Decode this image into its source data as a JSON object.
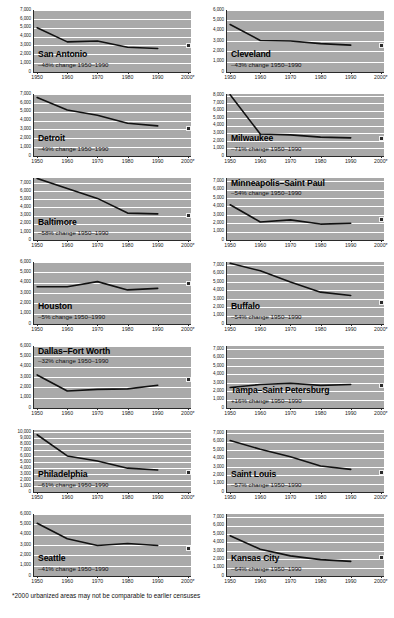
{
  "footnote": "*2000 urbanized areas may not be comparable to earlier censuses",
  "axis": {
    "x_ticks": [
      "1950",
      "1960",
      "1970",
      "1980",
      "1990",
      "2000*"
    ],
    "x_values": [
      1950,
      1960,
      1970,
      1980,
      1990,
      2000
    ]
  },
  "chart_data": [
    {
      "type": "line",
      "title": "San Antonio",
      "annotation": "–48% change 1950–1990",
      "label_position": "bottom",
      "xlabel": "",
      "ylabel": "",
      "ylim": [
        0,
        7000
      ],
      "yticks": [
        0,
        1000,
        2000,
        3000,
        4000,
        5000,
        6000,
        7000
      ],
      "ytick_labels": [
        "0",
        "1,000",
        "2,000",
        "3,000",
        "4,000",
        "5,000",
        "6,000",
        "7,000"
      ],
      "grid": true,
      "x": [
        1950,
        1960,
        1970,
        1980,
        1990
      ],
      "values": [
        5000,
        3400,
        3500,
        2800,
        2650
      ],
      "point_2000": 3050
    },
    {
      "type": "line",
      "title": "Detroit",
      "annotation": "–49% change 1950–1990",
      "label_position": "bottom",
      "xlabel": "",
      "ylabel": "",
      "ylim": [
        0,
        7000
      ],
      "yticks": [
        0,
        1000,
        2000,
        3000,
        4000,
        5000,
        6000,
        7000
      ],
      "ytick_labels": [
        "0",
        "1,000",
        "2,000",
        "3,000",
        "4,000",
        "5,000",
        "6,000",
        "7,000"
      ],
      "grid": true,
      "x": [
        1950,
        1960,
        1970,
        1980,
        1990
      ],
      "values": [
        6600,
        5200,
        4600,
        3700,
        3400
      ],
      "point_2000": 3250
    },
    {
      "type": "line",
      "title": "Baltimore",
      "annotation": "–58% change 1950–1990",
      "label_position": "bottom",
      "xlabel": "",
      "ylabel": "",
      "ylim": [
        0,
        7600
      ],
      "yticks": [
        0,
        1000,
        2000,
        3000,
        4000,
        5000,
        6000,
        7000
      ],
      "ytick_labels": [
        "0",
        "1,000",
        "2,000",
        "3,000",
        "4,000",
        "5,000",
        "6,000",
        "7,000"
      ],
      "grid": true,
      "x": [
        1950,
        1960,
        1970,
        1980,
        1990
      ],
      "values": [
        7550,
        6300,
        5100,
        3300,
        3200
      ],
      "point_2000": 3150
    },
    {
      "type": "line",
      "title": "Houston",
      "annotation": "–5% change 1950–1990",
      "label_position": "bottom",
      "xlabel": "",
      "ylabel": "",
      "ylim": [
        0,
        6000
      ],
      "yticks": [
        0,
        1000,
        2000,
        3000,
        4000,
        5000,
        6000
      ],
      "ytick_labels": [
        "0",
        "1,000",
        "2,000",
        "3,000",
        "4,000",
        "5,000",
        "6,000"
      ],
      "grid": true,
      "x": [
        1950,
        1960,
        1970,
        1980,
        1990
      ],
      "values": [
        3600,
        3600,
        4100,
        3300,
        3450
      ],
      "point_2000": 4000
    },
    {
      "type": "line",
      "title": "Dallas–Fort Worth",
      "annotation": "–32% change 1950–1990",
      "label_position": "top",
      "xlabel": "",
      "ylabel": "",
      "ylim": [
        0,
        6000
      ],
      "yticks": [
        0,
        1000,
        2000,
        3000,
        4000,
        5000,
        6000
      ],
      "ytick_labels": [
        "0",
        "1,000",
        "2,000",
        "3,000",
        "4,000",
        "5,000",
        "6,000"
      ],
      "grid": true,
      "x": [
        1950,
        1960,
        1970,
        1980,
        1990
      ],
      "values": [
        3200,
        1650,
        1800,
        1850,
        2200
      ],
      "point_2000": 2900
    },
    {
      "type": "line",
      "title": "Philadelphia",
      "annotation": "–61% change 1950–1990",
      "label_position": "bottom",
      "xlabel": "",
      "ylabel": "",
      "ylim": [
        0,
        10400
      ],
      "yticks": [
        0,
        1000,
        2000,
        3000,
        4000,
        5000,
        6000,
        7000,
        8000,
        9000,
        10000
      ],
      "ytick_labels": [
        "0",
        "1,000",
        "2,000",
        "3,000",
        "4,000",
        "5,000",
        "6,000",
        "7,000",
        "8,000",
        "9,000",
        "10,000"
      ],
      "grid": true,
      "x": [
        1950,
        1960,
        1970,
        1980,
        1990
      ],
      "values": [
        9600,
        6050,
        5200,
        4000,
        3700
      ],
      "point_2000": 3400
    },
    {
      "type": "line",
      "title": "Seattle",
      "annotation": "–41% change 1950–1990",
      "label_position": "bottom",
      "xlabel": "",
      "ylabel": "",
      "ylim": [
        0,
        6000
      ],
      "yticks": [
        0,
        1000,
        2000,
        3000,
        4000,
        5000,
        6000
      ],
      "ytick_labels": [
        "0",
        "1,000",
        "2,000",
        "3,000",
        "4,000",
        "5,000",
        "6,000"
      ],
      "grid": true,
      "x": [
        1950,
        1960,
        1970,
        1980,
        1990
      ],
      "values": [
        5100,
        3600,
        2950,
        3150,
        2950
      ],
      "point_2000": 2750
    },
    {
      "type": "line",
      "title": "Cleveland",
      "annotation": "–43% change 1950–1990",
      "label_position": "bottom",
      "xlabel": "",
      "ylabel": "",
      "ylim": [
        0,
        6000
      ],
      "yticks": [
        0,
        1000,
        2000,
        3000,
        4000,
        5000,
        6000
      ],
      "ytick_labels": [
        "0",
        "1,000",
        "2,000",
        "3,000",
        "4,000",
        "5,000",
        "6,000"
      ],
      "grid": true,
      "x": [
        1950,
        1960,
        1970,
        1980,
        1990
      ],
      "values": [
        4600,
        3050,
        3000,
        2750,
        2600
      ],
      "point_2000": 2700
    },
    {
      "type": "line",
      "title": "Milwaukee",
      "annotation": "–71% change 1950–1990",
      "label_position": "bottom",
      "xlabel": "",
      "ylabel": "",
      "ylim": [
        0,
        8200
      ],
      "yticks": [
        0,
        1000,
        2000,
        3000,
        4000,
        5000,
        6000,
        7000,
        8000
      ],
      "ytick_labels": [
        "0",
        "1,000",
        "2,000",
        "3,000",
        "4,000",
        "5,000",
        "6,000",
        "7,000",
        "8,000"
      ],
      "grid": true,
      "x": [
        1950,
        1960,
        1970,
        1980,
        1990
      ],
      "values": [
        8100,
        2900,
        2800,
        2500,
        2400
      ],
      "point_2000": 2400
    },
    {
      "type": "line",
      "title": "Minneapolis–Saint Paul",
      "annotation": "–54% change 1950–1990",
      "label_position": "top",
      "xlabel": "",
      "ylabel": "",
      "ylim": [
        0,
        7400
      ],
      "yticks": [
        0,
        1000,
        2000,
        3000,
        4000,
        5000,
        6000,
        7000
      ],
      "ytick_labels": [
        "0",
        "1,000",
        "2,000",
        "3,000",
        "4,000",
        "5,000",
        "6,000",
        "7,000"
      ],
      "grid": true,
      "x": [
        1950,
        1960,
        1970,
        1980,
        1990
      ],
      "values": [
        4200,
        2150,
        2400,
        1900,
        2000
      ],
      "point_2000": 2550
    },
    {
      "type": "line",
      "title": "Buffalo",
      "annotation": "–54% change 1950–1990",
      "label_position": "bottom",
      "xlabel": "",
      "ylabel": "",
      "ylim": [
        0,
        7400
      ],
      "yticks": [
        0,
        1000,
        2000,
        3000,
        4000,
        5000,
        6000,
        7000
      ],
      "ytick_labels": [
        "0",
        "1,000",
        "2,000",
        "3,000",
        "4,000",
        "5,000",
        "6,000",
        "7,000"
      ],
      "grid": true,
      "x": [
        1950,
        1960,
        1970,
        1980,
        1990
      ],
      "values": [
        7250,
        6350,
        5000,
        3800,
        3400
      ],
      "point_2000": 2650
    },
    {
      "type": "line",
      "title": "Tampa–Saint Petersburg",
      "annotation": "+16% change 1950–1990",
      "label_position": "bottom",
      "xlabel": "",
      "ylabel": "",
      "ylim": [
        0,
        7400
      ],
      "yticks": [
        0,
        1000,
        2000,
        3000,
        4000,
        5000,
        6000,
        7000
      ],
      "ytick_labels": [
        "0",
        "1,000",
        "2,000",
        "3,000",
        "4,000",
        "5,000",
        "6,000",
        "7,000"
      ],
      "grid": true,
      "x": [
        1950,
        1960,
        1970,
        1980,
        1990
      ],
      "values": [
        2450,
        2800,
        2950,
        2700,
        2800
      ],
      "point_2000": 2800
    },
    {
      "type": "line",
      "title": "Saint Louis",
      "annotation": "–57% change 1950–1990",
      "label_position": "bottom",
      "xlabel": "",
      "ylabel": "",
      "ylim": [
        0,
        7400
      ],
      "yticks": [
        0,
        1000,
        2000,
        3000,
        4000,
        5000,
        6000,
        7000
      ],
      "ytick_labels": [
        "0",
        "1,000",
        "2,000",
        "3,000",
        "4,000",
        "5,000",
        "6,000",
        "7,000"
      ],
      "grid": true,
      "x": [
        1950,
        1960,
        1970,
        1980,
        1990
      ],
      "values": [
        6150,
        5100,
        4200,
        3100,
        2700
      ],
      "point_2000": 2500
    },
    {
      "type": "line",
      "title": "Kansas City",
      "annotation": "–64% change 1950–1990",
      "label_position": "bottom",
      "xlabel": "",
      "ylabel": "",
      "ylim": [
        0,
        7400
      ],
      "yticks": [
        0,
        1000,
        2000,
        3000,
        4000,
        5000,
        6000,
        7000
      ],
      "ytick_labels": [
        "0",
        "1,000",
        "2,000",
        "3,000",
        "4,000",
        "5,000",
        "6,000",
        "7,000"
      ],
      "grid": true,
      "x": [
        1950,
        1960,
        1970,
        1980,
        1990
      ],
      "values": [
        4800,
        3200,
        2400,
        1950,
        1750
      ],
      "point_2000": 2300
    }
  ],
  "layout": {
    "left_column_indices": [
      0,
      1,
      2,
      3,
      4,
      5,
      6
    ],
    "right_column_indices": [
      7,
      8,
      9,
      10,
      11,
      12,
      13
    ],
    "panel_height": 84,
    "plot_color": "#a9a9a9",
    "gridline_color": "#ffffff",
    "line_color": "#111111",
    "marker_color": "#2b2b2b"
  }
}
